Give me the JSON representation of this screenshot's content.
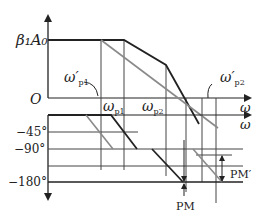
{
  "diagram": {
    "type": "bode-plot-asymptotic",
    "magnitude": {
      "y_label": "β₁A₀",
      "origin_label": "O",
      "x_axis_label": "ω",
      "corner_labels": [
        {
          "id": "wp1",
          "text": "ω",
          "sub": "p1"
        },
        {
          "id": "wp2",
          "text": "ω",
          "sub": "p2"
        },
        {
          "id": "wp1_prime",
          "text": "ω′",
          "sub": "p1"
        },
        {
          "id": "wp2_prime",
          "text": "ω′",
          "sub": "p2"
        }
      ]
    },
    "phase": {
      "x_axis_label": "ω",
      "tick_labels": [
        "−45°",
        "−90°",
        "−180°"
      ],
      "margin_labels": [
        "PM",
        "PM′"
      ]
    },
    "colors": {
      "original": "#222222",
      "compensated": "#8a8a8a",
      "grid": "#444444"
    }
  }
}
